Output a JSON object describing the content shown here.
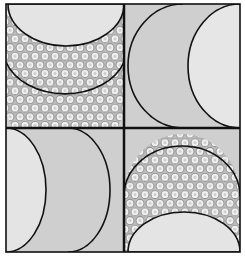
{
  "figure": {
    "tiles": [
      {
        "position": "top-left",
        "motif": "bowl-arc-with-hex-pattern",
        "orientation": "down"
      },
      {
        "position": "top-right",
        "motif": "double-crescent",
        "orientation": "left"
      },
      {
        "position": "bottom-left",
        "motif": "double-crescent",
        "orientation": "right"
      },
      {
        "position": "bottom-right",
        "motif": "dome-arc-with-hex-pattern",
        "orientation": "up"
      }
    ],
    "colors": {
      "background": "#ffffff",
      "tile_fill": "#cfcfcf",
      "light_fill": "#e4e4e4",
      "line": "#111111",
      "hex_stroke": "#9a9a9a",
      "hex_fill": "#f2f2f2"
    }
  }
}
